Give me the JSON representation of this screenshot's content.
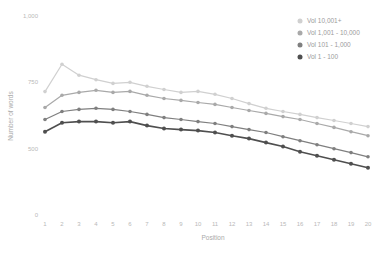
{
  "chart_data": {
    "type": "line",
    "title": "",
    "xlabel": "Position",
    "ylabel": "Number of words",
    "x": [
      1,
      2,
      3,
      4,
      5,
      6,
      7,
      8,
      9,
      10,
      11,
      12,
      13,
      14,
      15,
      16,
      17,
      18,
      19,
      20
    ],
    "x_tick_labels": [
      "1",
      "2",
      "3",
      "4",
      "5",
      "6",
      "7",
      "8",
      "9",
      "10",
      "11",
      "12",
      "13",
      "14",
      "15",
      "16",
      "17",
      "18",
      "19",
      "20"
    ],
    "y_ticks": [
      0,
      500,
      750,
      1000
    ],
    "y_tick_labels": [
      "0",
      "500",
      "750",
      "1,000"
    ],
    "ylim": [
      0,
      1000
    ],
    "grid": false,
    "legend_position": "top-right",
    "axis_note": "y ticks evenly spaced; 0-500 range compressed vs 500-1000",
    "series": [
      {
        "name": "Vol 10,001+",
        "color": "#d0d0d0",
        "values": [
          715,
          818,
          777,
          760,
          746,
          750,
          735,
          723,
          712,
          716,
          705,
          689,
          670,
          652,
          640,
          629,
          617,
          606,
          595,
          583
        ]
      },
      {
        "name": "Vol 1,001 - 10,000",
        "color": "#a9a9a9",
        "values": [
          655,
          701,
          712,
          720,
          712,
          716,
          701,
          689,
          682,
          674,
          667,
          655,
          644,
          633,
          621,
          610,
          595,
          580,
          564,
          549
        ]
      },
      {
        "name": "Vol 101 - 1,000",
        "color": "#7f7f7f",
        "values": [
          610,
          640,
          648,
          652,
          648,
          640,
          629,
          617,
          610,
          602,
          595,
          583,
          572,
          561,
          545,
          530,
          515,
          500,
          470,
          439
        ]
      },
      {
        "name": "Vol 1 - 100",
        "color": "#4f4f4f",
        "values": [
          564,
          598,
          602,
          602,
          598,
          602,
          587,
          576,
          572,
          568,
          561,
          549,
          538,
          523,
          508,
          477,
          447,
          417,
          386,
          356
        ]
      }
    ],
    "text_colors": {
      "ticks": "#b9b9b9",
      "axis_labels": "#a9a9a9",
      "legend": "#9b9b9b"
    }
  }
}
